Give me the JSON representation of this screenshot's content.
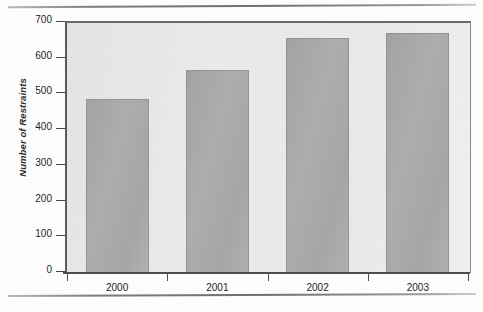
{
  "figure": {
    "y_axis_title": "Number of Restraints"
  },
  "chart_data": {
    "type": "bar",
    "title": "",
    "subtitle": "",
    "xlabel": "",
    "ylabel": "Number of Restraints",
    "categories": [
      "2000",
      "2001",
      "2002",
      "2003"
    ],
    "values": [
      485,
      565,
      655,
      670
    ],
    "series": [
      {
        "name": "Number of Restraints",
        "values": [
          485,
          565,
          655,
          670
        ]
      }
    ],
    "ylim": [
      0,
      700
    ],
    "ytick_labels": [
      "0",
      "100",
      "200",
      "300",
      "400",
      "500",
      "600",
      "700"
    ],
    "ytick_values": [
      0,
      100,
      200,
      300,
      400,
      500,
      600,
      700
    ],
    "grid": false,
    "legend": "none",
    "orientation": "vertical",
    "bar_color": "#a8a8a8",
    "plot_background": "#e8e8e6",
    "axis_color": "#4f4f4f"
  }
}
